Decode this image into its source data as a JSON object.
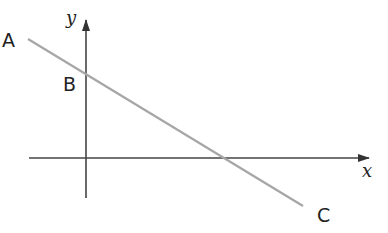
{
  "diagram": {
    "type": "coordinate-line-diagram",
    "axes": {
      "x_label": "x",
      "y_label": "y",
      "color": "#444444"
    },
    "line": {
      "color": "#a6a6a6",
      "points": [
        "A",
        "B",
        "C"
      ]
    },
    "labels": {
      "A": "A",
      "B": "B",
      "C": "C"
    }
  }
}
